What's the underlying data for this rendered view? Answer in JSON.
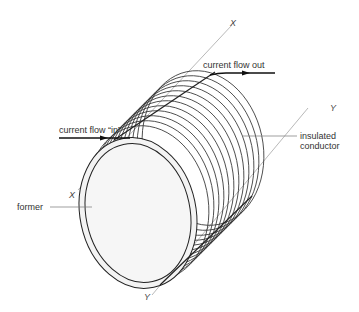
{
  "diagram": {
    "labels": {
      "current_in": "current flow “in”",
      "current_out": "current flow out",
      "insulated_conductor_line1": "insulated",
      "insulated_conductor_line2": "conductor",
      "former": "former",
      "axis_x_top": "X",
      "axis_x_bottom": "X",
      "axis_y_top": "Y",
      "axis_y_bottom": "Y"
    },
    "colors": {
      "stroke": "#222222",
      "leader": "#777777",
      "former_fill": "#f3f3f3"
    },
    "turns": 13
  }
}
